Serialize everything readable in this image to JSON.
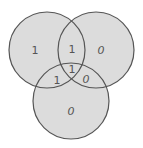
{
  "diagram": {
    "type": "venn-3",
    "colors": {
      "background": "#ffffff",
      "fill": "#dcdcdc",
      "stroke": "#555555",
      "label": "#555555"
    },
    "circles": [
      {
        "name": "left",
        "cx": 47,
        "cy": 50,
        "r": 38
      },
      {
        "name": "right",
        "cx": 96,
        "cy": 50,
        "r": 38
      },
      {
        "name": "bottom",
        "cx": 71,
        "cy": 101,
        "r": 38
      }
    ],
    "regions": {
      "left_only": "1",
      "left_right": "1",
      "right_only": "0",
      "left_bottom": "1",
      "all_three": "1",
      "right_bottom": "0",
      "bottom_only": "0"
    }
  }
}
